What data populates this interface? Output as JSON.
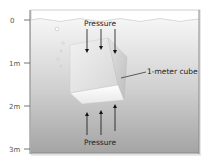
{
  "diagram": {
    "title": "",
    "axis": {
      "ticks": [
        {
          "label": "0",
          "y": 20
        },
        {
          "label": "1m",
          "y": 63
        },
        {
          "label": "2m",
          "y": 106
        },
        {
          "label": "3m",
          "y": 149
        }
      ]
    },
    "labels": {
      "top_pressure": "Pressure",
      "bottom_pressure": "Pressure",
      "cube": "1-meter cube"
    },
    "colors": {
      "water_top": "#f4f4f4",
      "water_bottom": "#a9a9a9",
      "cube_light": "#f0f0f0",
      "cube_mid": "#d4d4d4",
      "cube_dark": "#b8b8b8",
      "arrow": "#111111",
      "frame": "#8a8a8a"
    }
  }
}
